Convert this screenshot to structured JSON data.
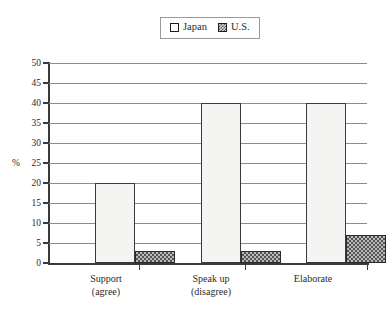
{
  "legend": {
    "position": "top-center",
    "entries": [
      {
        "label": "Japan",
        "icon": "empty-square-swatch",
        "color": "#ffffff"
      },
      {
        "label": "U.S.",
        "icon": "checkered-square-swatch",
        "color": "#7a7a7a"
      }
    ]
  },
  "axis": {
    "y_title": "%",
    "y_ticks": [
      50,
      45,
      40,
      35,
      30,
      25,
      20,
      15,
      10,
      5,
      0
    ]
  },
  "chart_data": {
    "type": "bar",
    "title": "",
    "xlabel": "",
    "ylabel": "%",
    "ylim": [
      0,
      50
    ],
    "ytick_step": 5,
    "grid": true,
    "legend_position": "top-center",
    "categories": [
      "Support (agree)",
      "Speak up (disagree)",
      "Elaborate"
    ],
    "category_lines": [
      [
        "Support",
        "(agree)"
      ],
      [
        "Speak up",
        "(disagree)"
      ],
      [
        "Elaborate"
      ]
    ],
    "series": [
      {
        "name": "Japan",
        "values": [
          20,
          40,
          40
        ],
        "fill": "#f4f4f2"
      },
      {
        "name": "U.S.",
        "values": [
          3,
          3,
          7
        ],
        "fill": "#b9b9b9"
      }
    ]
  }
}
